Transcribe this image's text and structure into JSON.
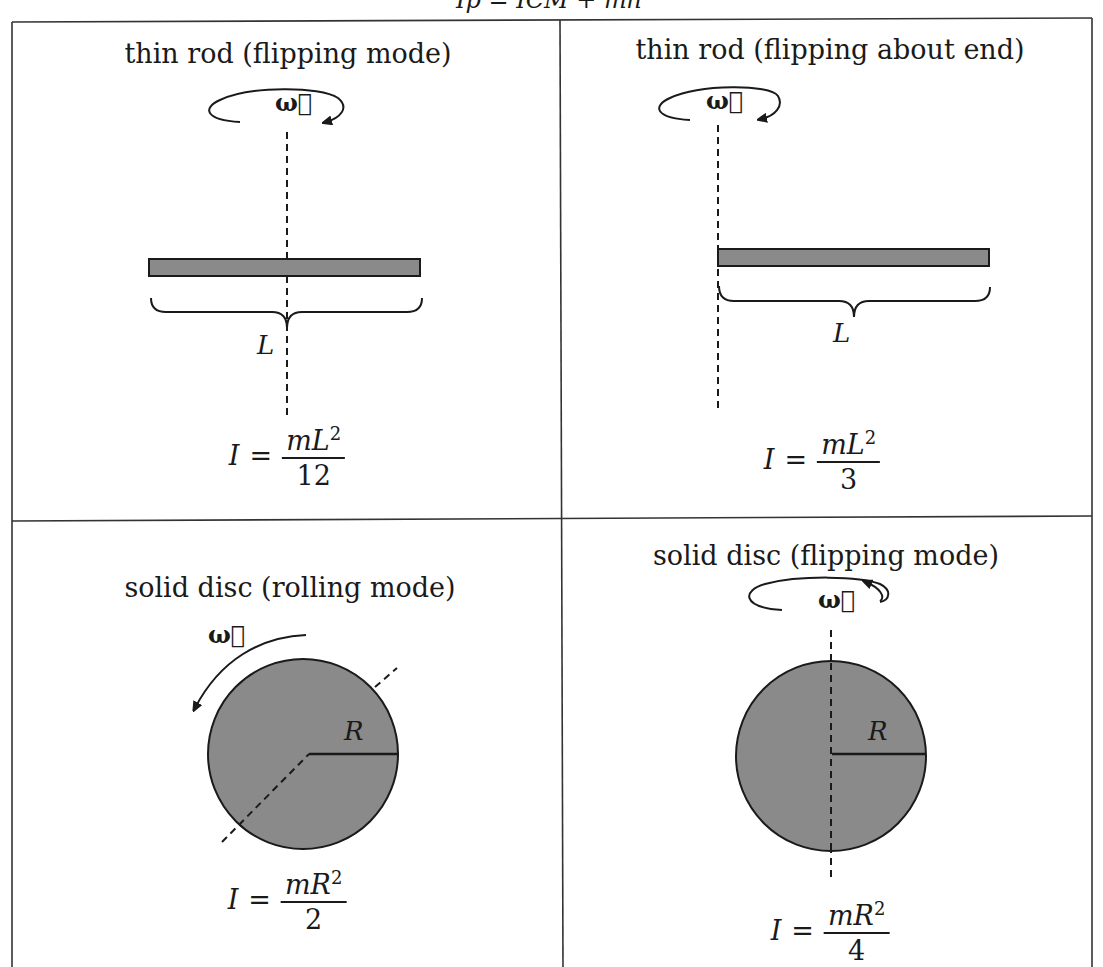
{
  "header": {
    "formula_text": "I_p = I_CM + mh²",
    "formula_display": "Ip = ICM + mh²"
  },
  "cells": [
    {
      "title": "thin rod (flipping mode)",
      "omega_label": "ω⃗",
      "dimension_label": "L",
      "formula": {
        "lhs": "I",
        "eq": "=",
        "numerator": "mL",
        "exponent": "2",
        "denominator": "12"
      }
    },
    {
      "title": "thin rod (flipping about end)",
      "omega_label": "ω⃗",
      "dimension_label": "L",
      "formula": {
        "lhs": "I",
        "eq": "=",
        "numerator": "mL",
        "exponent": "2",
        "denominator": "3"
      }
    },
    {
      "title": "solid disc (rolling mode)",
      "omega_label": "ω⃗",
      "dimension_label": "R",
      "formula": {
        "lhs": "I",
        "eq": "=",
        "numerator": "mR",
        "exponent": "2",
        "denominator": "2"
      }
    },
    {
      "title": "solid disc (flipping mode)",
      "omega_label": "ω⃗",
      "dimension_label": "R",
      "formula": {
        "lhs": "I",
        "eq": "=",
        "numerator": "mR",
        "exponent": "2",
        "denominator": "4"
      }
    }
  ],
  "colors": {
    "object_fill": "#8a8a8a",
    "line": "#1a1a1a",
    "background": "#ffffff"
  }
}
